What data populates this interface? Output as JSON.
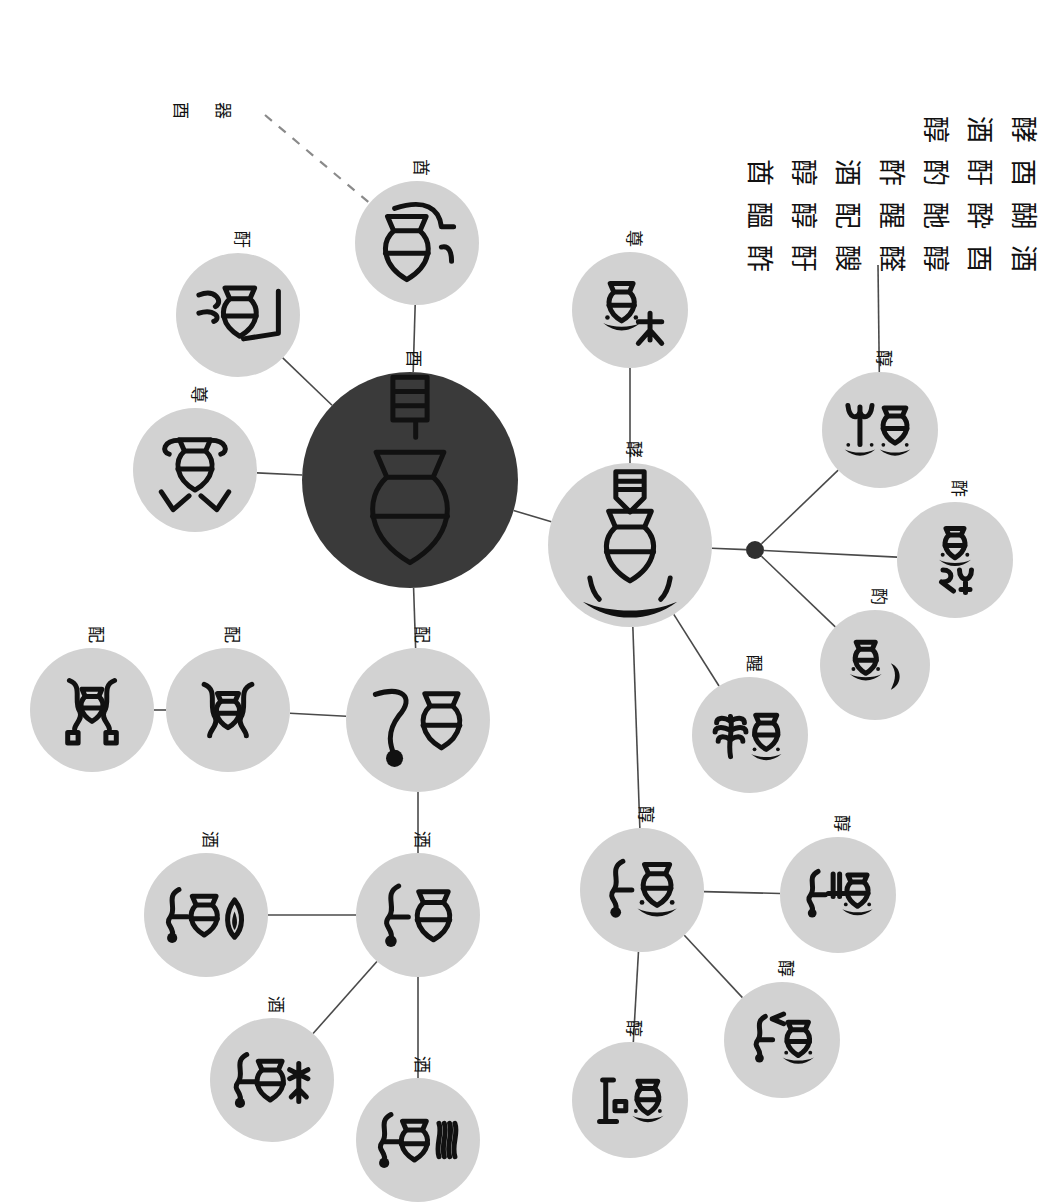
{
  "figure": {
    "background_color": "#ffffff",
    "node_fill": "#d2d2d2",
    "root_node_fill": "#3a3a3a",
    "edge_color": "#4a4a4a",
    "glyph_ink_color": "#111111"
  },
  "nodes": [
    {
      "id": "root",
      "label": "酉",
      "label_reading": "you / vessel",
      "cx": 410,
      "cy": 480,
      "r": 108,
      "variant": "root",
      "glyph": "root-vessel"
    },
    {
      "id": "n_top",
      "label": "酋",
      "label_reading": "qiu",
      "cx": 417,
      "cy": 243,
      "r": 62,
      "variant": "light",
      "glyph": "vessel-hook"
    },
    {
      "id": "n_upleft",
      "label": "酑",
      "label_reading": "yin-hand",
      "cx": 238,
      "cy": 315,
      "r": 62,
      "variant": "light",
      "glyph": "hand-vessel-frame"
    },
    {
      "id": "n_left",
      "label": "尊",
      "label_reading": "zun",
      "cx": 195,
      "cy": 470,
      "r": 62,
      "variant": "light",
      "glyph": "vessel-two-hands"
    },
    {
      "id": "n_below",
      "label": "配",
      "label_reading": "pei",
      "cx": 418,
      "cy": 720,
      "r": 72,
      "variant": "light",
      "glyph": "kneel-vessel"
    },
    {
      "id": "n_pei_b",
      "label": "配",
      "label_reading": "pei variant",
      "cx": 228,
      "cy": 710,
      "r": 62,
      "variant": "light",
      "glyph": "twin-arms-vessel"
    },
    {
      "id": "n_pei_c",
      "label": "配",
      "label_reading": "pei variant 2",
      "cx": 92,
      "cy": 710,
      "r": 62,
      "variant": "light",
      "glyph": "twin-arms-vessel-boxes"
    },
    {
      "id": "n_jiu",
      "label": "酒",
      "label_reading": "jiu / wine",
      "cx": 418,
      "cy": 915,
      "r": 62,
      "variant": "light",
      "glyph": "water-vessel"
    },
    {
      "id": "n_jiu_l",
      "label": "酒",
      "label_reading": "jiu variant",
      "cx": 206,
      "cy": 915,
      "r": 62,
      "variant": "light",
      "glyph": "water-vessel-flame"
    },
    {
      "id": "n_jiu_lb",
      "label": "酒",
      "label_reading": "jiu variant 2",
      "cx": 272,
      "cy": 1080,
      "r": 62,
      "variant": "light",
      "glyph": "water-vessel-cross"
    },
    {
      "id": "n_jiu_bb",
      "label": "酒",
      "label_reading": "jiu variant 3",
      "cx": 418,
      "cy": 1140,
      "r": 62,
      "variant": "light",
      "glyph": "water-vessel-rays"
    },
    {
      "id": "n_zun_r",
      "label": "尊",
      "label_reading": "zun-offering",
      "cx": 630,
      "cy": 310,
      "r": 58,
      "variant": "light",
      "glyph": "vessel-table-person"
    },
    {
      "id": "n_hub",
      "label": "酵",
      "label_reading": "hub vessel",
      "cx": 630,
      "cy": 545,
      "r": 82,
      "variant": "light",
      "glyph": "vessel-table-horns"
    },
    {
      "id": "n_up_r",
      "label": "醇",
      "label_reading": "chun",
      "cx": 880,
      "cy": 430,
      "r": 58,
      "variant": "light",
      "glyph": "plant-vessel-tables"
    },
    {
      "id": "n_mid_r",
      "label": "酢",
      "label_reading": "cu",
      "cx": 955,
      "cy": 560,
      "r": 58,
      "variant": "light",
      "glyph": "vessel-table-bi"
    },
    {
      "id": "n_low_r",
      "label": "酌",
      "label_reading": "zhuo",
      "cx": 875,
      "cy": 665,
      "r": 55,
      "variant": "light",
      "glyph": "vessel-table-ladle"
    },
    {
      "id": "n_tree",
      "label": "醒",
      "label_reading": "xing",
      "cx": 750,
      "cy": 735,
      "r": 58,
      "variant": "light",
      "glyph": "tree-vessel-table"
    },
    {
      "id": "n_sh_main",
      "label": "醇",
      "label_reading": "chun / shun",
      "cx": 642,
      "cy": 890,
      "r": 62,
      "variant": "light",
      "glyph": "person-vessel-table"
    },
    {
      "id": "n_sh_r",
      "label": "醇",
      "label_reading": "chun variant",
      "cx": 838,
      "cy": 895,
      "r": 58,
      "variant": "light",
      "glyph": "person-plant-vessel"
    },
    {
      "id": "n_sh_br",
      "label": "醇",
      "label_reading": "chun variant 2",
      "cx": 782,
      "cy": 1040,
      "r": 58,
      "variant": "light",
      "glyph": "person-hook-vessel"
    },
    {
      "id": "n_sh_b",
      "label": "醇",
      "label_reading": "chun variant 3",
      "cx": 630,
      "cy": 1100,
      "r": 58,
      "variant": "light",
      "glyph": "post-vessel-table"
    }
  ],
  "edges": [
    {
      "from": "root",
      "to": "n_top",
      "style": "solid"
    },
    {
      "from": "root",
      "to": "n_upleft",
      "style": "solid"
    },
    {
      "from": "root",
      "to": "n_left",
      "style": "solid"
    },
    {
      "from": "root",
      "to": "n_below",
      "style": "solid"
    },
    {
      "from": "root",
      "to": "n_hub",
      "style": "solid"
    },
    {
      "from": "n_below",
      "to": "n_pei_b",
      "style": "solid"
    },
    {
      "from": "n_pei_b",
      "to": "n_pei_c",
      "style": "solid"
    },
    {
      "from": "n_below",
      "to": "n_jiu",
      "style": "solid"
    },
    {
      "from": "n_jiu",
      "to": "n_jiu_l",
      "style": "solid"
    },
    {
      "from": "n_jiu",
      "to": "n_jiu_lb",
      "style": "solid"
    },
    {
      "from": "n_jiu",
      "to": "n_jiu_bb",
      "style": "solid"
    },
    {
      "from": "n_hub",
      "to": "n_zun_r",
      "style": "solid"
    },
    {
      "from": "n_hub",
      "to": "junction",
      "style": "solid"
    },
    {
      "from": "junction",
      "to": "n_up_r",
      "style": "solid"
    },
    {
      "from": "junction",
      "to": "n_mid_r",
      "style": "solid"
    },
    {
      "from": "junction",
      "to": "n_low_r",
      "style": "solid"
    },
    {
      "from": "n_hub",
      "to": "n_tree",
      "style": "solid"
    },
    {
      "from": "n_hub",
      "to": "n_sh_main",
      "style": "solid"
    },
    {
      "from": "n_sh_main",
      "to": "n_sh_r",
      "style": "solid"
    },
    {
      "from": "n_sh_main",
      "to": "n_sh_br",
      "style": "solid"
    },
    {
      "from": "n_sh_main",
      "to": "n_sh_b",
      "style": "solid"
    },
    {
      "from": "corpus",
      "to": "n_up_r",
      "style": "solid"
    },
    {
      "from": "annotation",
      "to": "n_top",
      "style": "dashed"
    }
  ],
  "junction": {
    "cx": 755,
    "cy": 550,
    "r": 9
  },
  "annotation": {
    "text": "酉器 群",
    "chars": [
      "酉",
      "器"
    ],
    "x": 175,
    "y": 110
  },
  "corpus": {
    "caption": "inscription character list",
    "x": 728,
    "y": 105,
    "rows": [
      [
        "醇",
        "酒",
        "酵"
      ],
      [
        "酋",
        "醇",
        "酒",
        "酢",
        "酌",
        "酑",
        "酉"
      ],
      [
        "醞",
        "醇",
        "配",
        "醒",
        "酏",
        "酔",
        "醐"
      ],
      [
        "酢",
        "酑",
        "醙",
        "醛",
        "醇",
        "酉",
        "酒"
      ]
    ]
  },
  "legend": {
    "root_note": "root node (dark disc)",
    "derived_note": "derived form (light disc)"
  }
}
